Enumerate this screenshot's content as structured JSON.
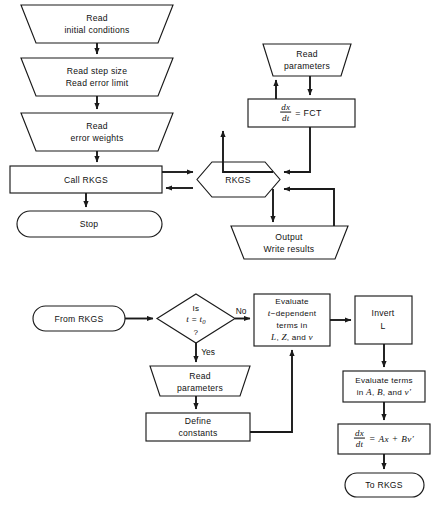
{
  "diagram": {
    "background_color": "#ffffff",
    "line_color": "#1a1a1a",
    "text_color": "#111111"
  },
  "top_chart": {
    "name": "main-program-and-rkgs-flowchart",
    "nodes": [
      {
        "id": "read-initial-conditions",
        "shape": "trapezoid-inverted",
        "lines": [
          "Read",
          "initial conditions"
        ]
      },
      {
        "id": "read-step-size",
        "shape": "trapezoid-inverted",
        "lines": [
          "Read step size",
          "Read error limit"
        ]
      },
      {
        "id": "read-error-weights",
        "shape": "trapezoid-inverted",
        "lines": [
          "Read",
          "error weights"
        ]
      },
      {
        "id": "call-rkgs",
        "shape": "rectangle",
        "lines": [
          "Call RKGS"
        ]
      },
      {
        "id": "stop",
        "shape": "terminal",
        "lines": [
          "Stop"
        ]
      },
      {
        "id": "rkgs",
        "shape": "hexagon",
        "lines": [
          "RKGS"
        ]
      },
      {
        "id": "read-parameters",
        "shape": "trapezoid-inverted",
        "lines": [
          "Read",
          "parameters"
        ]
      },
      {
        "id": "dxdt-fct",
        "shape": "rectangle",
        "equation": {
          "fraction_num": "dx",
          "fraction_den": "dt",
          "rhs": "= FCT"
        }
      },
      {
        "id": "output-write-results",
        "shape": "trapezoid-inverted",
        "lines": [
          "Output",
          "Write results"
        ]
      }
    ]
  },
  "bottom_chart": {
    "name": "fct-subroutine-flowchart",
    "nodes": [
      {
        "id": "from-rkgs",
        "shape": "terminal",
        "lines": [
          "From  RKGS"
        ]
      },
      {
        "id": "decision-t-equals-t0",
        "shape": "diamond",
        "lines": [
          "Is",
          "t = t0",
          "?"
        ]
      },
      {
        "id": "read-parameters-2",
        "shape": "trapezoid-inverted",
        "lines": [
          "Read",
          "parameters"
        ]
      },
      {
        "id": "define-constants",
        "shape": "rectangle",
        "lines": [
          "Define",
          "constants"
        ]
      },
      {
        "id": "evaluate-t-dependent",
        "shape": "rectangle",
        "lines": [
          "Evaluate",
          "t−dependent",
          "terms in",
          "L, Z, and v"
        ]
      },
      {
        "id": "invert-l",
        "shape": "rectangle",
        "lines": [
          "Invert",
          "L"
        ]
      },
      {
        "id": "evaluate-terms-abv",
        "shape": "rectangle",
        "lines": [
          "Evaluate terms",
          "in A, B, and v′"
        ]
      },
      {
        "id": "dxdt-ax-bv",
        "shape": "rectangle",
        "equation": {
          "fraction_num": "dx",
          "fraction_den": "dt",
          "rhs": "= Ax + Bv′"
        }
      },
      {
        "id": "to-rkgs",
        "shape": "terminal",
        "lines": [
          "To RKGS"
        ]
      }
    ],
    "edge_labels": {
      "no": "No",
      "yes": "Yes"
    }
  },
  "labels": {
    "read_initial_1": "Read",
    "read_initial_2": "initial conditions",
    "read_step_1": "Read step size",
    "read_step_2": "Read error limit",
    "read_weights_1": "Read",
    "read_weights_2": "error weights",
    "call_rkgs": "Call  RKGS",
    "stop": "Stop",
    "rkgs": "RKGS",
    "read_params_1": "Read",
    "read_params_2": "parameters",
    "fct_rhs": "= FCT",
    "output_1": "Output",
    "output_2": "Write results",
    "from_rkgs": "From  RKGS",
    "dec_1": "Is",
    "dec_3": "?",
    "no": "No",
    "yes": "Yes",
    "read_params_b1": "Read",
    "read_params_b2": "parameters",
    "define_1": "Define",
    "define_2": "constants",
    "eval_t_1": "Evaluate",
    "eval_t_3": "terms  in",
    "invert_1": "Invert",
    "invert_2": "L",
    "eval_terms_1": "Evaluate  terms",
    "to_rkgs": "To RKGS"
  }
}
